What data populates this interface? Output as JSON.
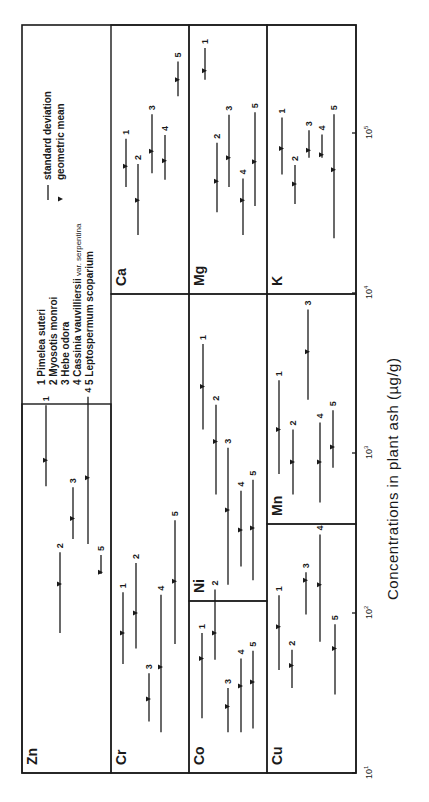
{
  "chart_data": {
    "type": "range-plot",
    "title": "",
    "xlabel": "Concentrations in plant ash (µg/g)",
    "ylabel": "",
    "scale": "log",
    "xlim": [
      10,
      470000
    ],
    "ticks": [
      {
        "value": 10,
        "base": "10",
        "exp": "1"
      },
      {
        "value": 100,
        "base": "10",
        "exp": "2"
      },
      {
        "value": 1000,
        "base": "10",
        "exp": "3"
      },
      {
        "value": 10000,
        "base": "10",
        "exp": "4"
      },
      {
        "value": 100000,
        "base": "10",
        "exp": "5"
      }
    ],
    "legend": {
      "species": [
        {
          "id": "1",
          "name": "Pimelea suteri"
        },
        {
          "id": "2",
          "name": "Myosotis monroi"
        },
        {
          "id": "3",
          "name": "Hebe odora"
        },
        {
          "id": "4",
          "name": "Cassinia vauvilliersii",
          "qualifier": "var. serpentina"
        },
        {
          "id": "5",
          "name": "Leptospermum scoparium"
        }
      ],
      "symbols": [
        {
          "symbol": "line",
          "label": "standard deviation"
        },
        {
          "symbol": "triangle",
          "label": "geometric mean"
        }
      ]
    },
    "elements": [
      {
        "element": "Zn",
        "series": [
          {
            "id": "1",
            "low": 620,
            "mean": 900,
            "high": 1990
          },
          {
            "id": "2",
            "low": 75,
            "mean": 152,
            "high": 240
          },
          {
            "id": "3",
            "low": 290,
            "mean": 390,
            "high": 610
          },
          {
            "id": "4",
            "low": 270,
            "mean": 700,
            "high": 2250
          },
          {
            "id": "5",
            "low": 175,
            "mean": 180,
            "high": 230
          }
        ]
      },
      {
        "element": "Cr",
        "series": [
          {
            "id": "1",
            "low": 48,
            "mean": 75,
            "high": 135
          },
          {
            "id": "2",
            "low": 60,
            "mean": 100,
            "high": 205
          },
          {
            "id": "3",
            "low": 21,
            "mean": 29,
            "high": 42
          },
          {
            "id": "4",
            "low": 18,
            "mean": 46,
            "high": 130
          },
          {
            "id": "5",
            "low": 64,
            "mean": 158,
            "high": 380
          }
        ]
      },
      {
        "element": "Co",
        "series": [
          {
            "id": "1",
            "low": 22,
            "mean": 52,
            "high": 75
          },
          {
            "id": "2",
            "low": 51,
            "mean": 75,
            "high": 140
          },
          {
            "id": "3",
            "low": 18,
            "mean": 26,
            "high": 34
          },
          {
            "id": "4",
            "low": 18,
            "mean": 35,
            "high": 52
          },
          {
            "id": "5",
            "low": 19,
            "mean": 37,
            "high": 58
          }
        ]
      },
      {
        "element": "Ni",
        "series": [
          {
            "id": "1",
            "low": 1400,
            "mean": 2600,
            "high": 4800
          },
          {
            "id": "2",
            "low": 550,
            "mean": 1180,
            "high": 2000
          },
          {
            "id": "3",
            "low": 150,
            "mean": 440,
            "high": 1080
          },
          {
            "id": "4",
            "low": 195,
            "mean": 330,
            "high": 580
          },
          {
            "id": "5",
            "low": 160,
            "mean": 340,
            "high": 680
          }
        ]
      },
      {
        "element": "Cu",
        "series": [
          {
            "id": "1",
            "low": 44,
            "mean": 82,
            "high": 129
          },
          {
            "id": "2",
            "low": 34,
            "mean": 47,
            "high": 59
          },
          {
            "id": "3",
            "low": 98,
            "mean": 160,
            "high": 180
          },
          {
            "id": "4",
            "low": 66,
            "mean": 150,
            "high": 310
          },
          {
            "id": "5",
            "low": 31,
            "mean": 60,
            "high": 85
          }
        ]
      },
      {
        "element": "Mn",
        "series": [
          {
            "id": "1",
            "low": 740,
            "mean": 1400,
            "high": 2850
          },
          {
            "id": "2",
            "low": 550,
            "mean": 880,
            "high": 1400
          },
          {
            "id": "3",
            "low": 2150,
            "mean": 4300,
            "high": 7900
          },
          {
            "id": "4",
            "low": 490,
            "mean": 880,
            "high": 1550
          },
          {
            "id": "5",
            "low": 810,
            "mean": 1090,
            "high": 1850
          }
        ]
      },
      {
        "element": "Ca",
        "series": [
          {
            "id": "1",
            "low": 46000,
            "mean": 62000,
            "high": 92000
          },
          {
            "id": "2",
            "low": 23000,
            "mean": 38000,
            "high": 64000
          },
          {
            "id": "3",
            "low": 56000,
            "mean": 77000,
            "high": 131000
          },
          {
            "id": "4",
            "low": 51000,
            "mean": 67000,
            "high": 97000
          },
          {
            "id": "5",
            "low": 170000,
            "mean": 215000,
            "high": 280000
          }
        ]
      },
      {
        "element": "Mg",
        "series": [
          {
            "id": "1",
            "low": 215000,
            "mean": 245000,
            "high": 340000
          },
          {
            "id": "2",
            "low": 32000,
            "mean": 50000,
            "high": 87000
          },
          {
            "id": "3",
            "low": 46000,
            "mean": 70000,
            "high": 130000
          },
          {
            "id": "4",
            "low": 23000,
            "mean": 38000,
            "high": 52000
          },
          {
            "id": "5",
            "low": 35000,
            "mean": 66000,
            "high": 135000
          }
        ]
      },
      {
        "element": "K",
        "series": [
          {
            "id": "1",
            "low": 55000,
            "mean": 80000,
            "high": 125000
          },
          {
            "id": "2",
            "low": 36000,
            "mean": 48000,
            "high": 63000
          },
          {
            "id": "3",
            "low": 70000,
            "mean": 78000,
            "high": 104000
          },
          {
            "id": "4",
            "low": 70000,
            "mean": 73000,
            "high": 98000
          },
          {
            "id": "5",
            "low": 22000,
            "mean": 59000,
            "high": 131000
          }
        ]
      }
    ]
  },
  "layout": {
    "axisY0": 773,
    "axisPxPerDecade": 160,
    "axisMinExp": 1,
    "panels": [
      {
        "element": "Zn",
        "x0": 22,
        "x1": 111,
        "y0": 404,
        "y1": 773,
        "barX": [
          46,
          60,
          73,
          88,
          101
        ]
      },
      {
        "element": "Cr",
        "x0": 111,
        "x1": 189,
        "y0": 294,
        "y1": 773,
        "barX": [
          123,
          136,
          149,
          161,
          175
        ]
      },
      {
        "element": "Co",
        "x0": 189,
        "x1": 267,
        "y0": 601,
        "y1": 773,
        "barX": [
          202,
          215,
          228,
          241,
          253
        ]
      },
      {
        "element": "Ni",
        "x0": 189,
        "x1": 267,
        "y0": 294,
        "y1": 601,
        "barX": [
          203,
          216,
          228,
          241,
          253
        ]
      },
      {
        "element": "Cu",
        "x0": 267,
        "x1": 356,
        "y0": 524,
        "y1": 773,
        "barX": [
          279,
          292,
          306,
          320,
          335
        ]
      },
      {
        "element": "Mn",
        "x0": 267,
        "x1": 356,
        "y0": 294,
        "y1": 524,
        "barX": [
          279,
          293,
          308,
          320,
          333
        ]
      },
      {
        "element": "Ca",
        "x0": 111,
        "x1": 189,
        "y0": 25,
        "y1": 294,
        "barX": [
          126,
          138,
          152,
          165,
          178
        ]
      },
      {
        "element": "Mg",
        "x0": 189,
        "x1": 267,
        "y0": 25,
        "y1": 294,
        "barX": [
          205,
          217,
          229,
          243,
          255
        ]
      },
      {
        "element": "K",
        "x0": 267,
        "x1": 356,
        "y0": 25,
        "y1": 294,
        "barX": [
          282,
          295,
          309,
          322,
          334
        ]
      }
    ],
    "legendBox": {
      "x0": 22,
      "x1": 111,
      "y0": 25,
      "y1": 404
    },
    "frame": {
      "x0": 22,
      "x1": 356,
      "y0": 25,
      "y1": 773
    }
  }
}
